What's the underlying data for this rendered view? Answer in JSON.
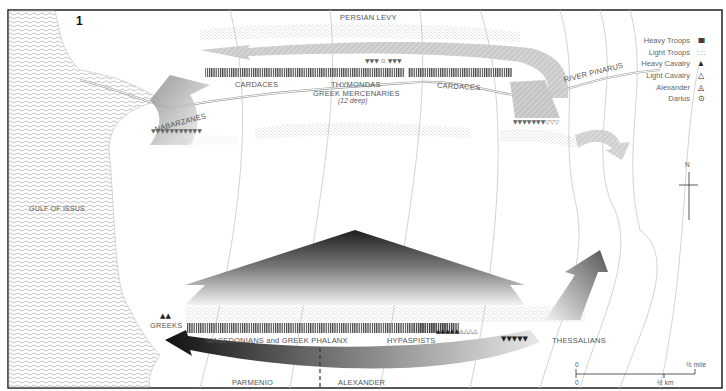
{
  "figure": {
    "number": "1",
    "colors": {
      "frame": "#222222",
      "sea_pattern": "#bbbbbb",
      "contour": "#c8c8c8",
      "troop_heavy": "#555555",
      "troop_light": "#aaaaaa",
      "arrow_dark": "#2a2a2a",
      "arrow_light": "#cfcfcf"
    }
  },
  "legend": {
    "items": [
      {
        "label": "Heavy Troops",
        "symbol": "IIIII",
        "icon": "heavy-troops-icon"
      },
      {
        "label": "Light Troops",
        "symbol": "::::",
        "icon": "light-troops-icon"
      },
      {
        "label": "Heavy Cavalry",
        "symbol": "▲",
        "icon": "heavy-cavalry-icon"
      },
      {
        "label": "Light Cavalry",
        "symbol": "△",
        "icon": "light-cavalry-icon"
      },
      {
        "label": "Alexander",
        "symbol": "◬",
        "icon": "alexander-icon"
      },
      {
        "label": "Darius",
        "symbol": "⊙",
        "icon": "darius-icon"
      }
    ]
  },
  "persian_side": {
    "persian_levy": "PERSIAN LEVY",
    "cardaces_left": "CARDACES",
    "thymondas": "THYMONDAS",
    "greek_mercenaries": "GREEK MERCENARIES",
    "depth": "(12 deep)",
    "cardaces_right": "CARDACES",
    "nabarzanes": "NABARZANES",
    "river": "RIVER PINARUS",
    "darius_group": "▼▼▼ ⊙ ▼▼▼"
  },
  "macedonian_side": {
    "greeks": "GREEKS",
    "phalanx": "MACEDONIANS and GREEK PHALANX",
    "depth": "16 deep",
    "hypaspists": "HYPASPISTS",
    "thessalians": "THESSALIANS",
    "parmenio": "PARMENIO",
    "alexander": "ALEXANDER"
  },
  "geography": {
    "gulf": "GULF OF ISSUS",
    "north": "N"
  },
  "scale": {
    "zero_top": "0",
    "mile": "½ mile",
    "zero_bottom": "0",
    "km": "½ km"
  }
}
